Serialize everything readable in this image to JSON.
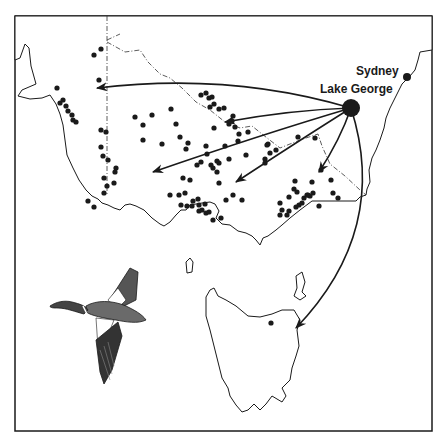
{
  "map": {
    "title": "Recovery locations of ducks banded at Lake George",
    "frame": {
      "x": 15,
      "y": 16,
      "w": 417,
      "h": 415
    },
    "colors": {
      "ink": "#1a1a1a",
      "background": "#ffffff"
    },
    "places": {
      "sydney": {
        "label": "Sydney",
        "x": 407,
        "y": 77,
        "r": 4
      },
      "lake_george": {
        "label": "Lake George",
        "x": 351,
        "y": 108,
        "r": 9
      }
    },
    "arrows": [
      {
        "name": "arrow-west-sa",
        "to": [
          97,
          88
        ],
        "ctrl": [
          230,
          72
        ]
      },
      {
        "name": "arrow-murray-north",
        "to": [
          225,
          122
        ],
        "ctrl": [
          290,
          110
        ]
      },
      {
        "name": "arrow-murray-south",
        "to": [
          153,
          172
        ],
        "ctrl": [
          260,
          135
        ]
      },
      {
        "name": "arrow-victoria-central",
        "to": [
          236,
          182
        ],
        "ctrl": [
          300,
          140
        ]
      },
      {
        "name": "arrow-gippsland",
        "to": [
          319,
          172
        ],
        "ctrl": [
          340,
          140
        ]
      },
      {
        "name": "arrow-tasmania",
        "to": [
          296,
          328
        ],
        "ctrl": [
          390,
          230
        ]
      }
    ],
    "recoveries": [
      [
        101,
        49
      ],
      [
        94,
        55
      ],
      [
        99,
        80
      ],
      [
        57,
        88
      ],
      [
        60,
        103
      ],
      [
        63,
        100
      ],
      [
        66,
        106
      ],
      [
        68,
        111
      ],
      [
        72,
        115
      ],
      [
        73,
        120
      ],
      [
        76,
        122
      ],
      [
        101,
        130
      ],
      [
        106,
        132
      ],
      [
        135,
        117
      ],
      [
        143,
        125
      ],
      [
        101,
        147
      ],
      [
        103,
        156
      ],
      [
        108,
        160
      ],
      [
        116,
        168
      ],
      [
        115,
        172
      ],
      [
        107,
        186
      ],
      [
        88,
        201
      ],
      [
        94,
        207
      ],
      [
        104,
        193
      ],
      [
        114,
        183
      ],
      [
        104,
        178
      ],
      [
        143,
        140
      ],
      [
        162,
        144
      ],
      [
        201,
        95
      ],
      [
        206,
        93
      ],
      [
        209,
        98
      ],
      [
        212,
        97
      ],
      [
        214,
        104
      ],
      [
        210,
        107
      ],
      [
        219,
        109
      ],
      [
        224,
        108
      ],
      [
        229,
        124
      ],
      [
        232,
        121
      ],
      [
        235,
        127
      ],
      [
        239,
        134
      ],
      [
        233,
        116
      ],
      [
        248,
        132
      ],
      [
        214,
        128
      ],
      [
        176,
        124
      ],
      [
        152,
        115
      ],
      [
        171,
        109
      ],
      [
        180,
        137
      ],
      [
        188,
        143
      ],
      [
        186,
        149
      ],
      [
        206,
        146
      ],
      [
        207,
        154
      ],
      [
        211,
        165
      ],
      [
        197,
        165
      ],
      [
        201,
        162
      ],
      [
        213,
        168
      ],
      [
        217,
        161
      ],
      [
        219,
        163
      ],
      [
        225,
        146
      ],
      [
        229,
        159
      ],
      [
        238,
        141
      ],
      [
        268,
        144
      ],
      [
        276,
        150
      ],
      [
        267,
        145
      ],
      [
        298,
        137
      ],
      [
        315,
        138
      ],
      [
        265,
        159
      ],
      [
        265,
        163
      ],
      [
        217,
        172
      ],
      [
        219,
        183
      ],
      [
        183,
        178
      ],
      [
        190,
        180
      ],
      [
        170,
        195
      ],
      [
        179,
        195
      ],
      [
        185,
        193
      ],
      [
        193,
        201
      ],
      [
        198,
        199
      ],
      [
        202,
        210
      ],
      [
        181,
        205
      ],
      [
        187,
        206
      ],
      [
        192,
        206
      ],
      [
        199,
        205
      ],
      [
        205,
        204
      ],
      [
        206,
        213
      ],
      [
        209,
        212
      ],
      [
        199,
        211
      ],
      [
        213,
        220
      ],
      [
        221,
        218
      ],
      [
        226,
        200
      ],
      [
        233,
        195
      ],
      [
        242,
        200
      ],
      [
        312,
        182
      ],
      [
        295,
        181
      ],
      [
        294,
        189
      ],
      [
        289,
        197
      ],
      [
        280,
        203
      ],
      [
        282,
        210
      ],
      [
        280,
        215
      ],
      [
        287,
        215
      ],
      [
        289,
        211
      ],
      [
        296,
        207
      ],
      [
        299,
        205
      ],
      [
        302,
        203
      ],
      [
        304,
        198
      ],
      [
        307,
        195
      ],
      [
        310,
        196
      ],
      [
        313,
        193
      ],
      [
        297,
        192
      ],
      [
        308,
        195
      ],
      [
        321,
        170
      ],
      [
        331,
        180
      ],
      [
        333,
        193
      ],
      [
        338,
        198
      ],
      [
        319,
        206
      ],
      [
        270,
        153
      ],
      [
        271,
        323
      ],
      [
        246,
        155
      ]
    ],
    "annotations": {
      "duck_illustration": "flying duck (shelduck) drawing"
    }
  }
}
